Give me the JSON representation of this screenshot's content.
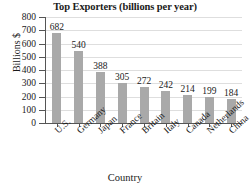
{
  "chart_data": {
    "type": "bar",
    "title": "Top Exporters (billions per year)",
    "xlabel": "Country",
    "ylabel": "Billions $",
    "categories": [
      "U.S.",
      "Germany",
      "Japan",
      "France",
      "Britain",
      "Italy",
      "Canada",
      "Netherlands",
      "China"
    ],
    "values": [
      682,
      540,
      388,
      305,
      272,
      242,
      214,
      199,
      184
    ],
    "ylim": [
      0,
      800
    ],
    "yticks": [
      800,
      700,
      600,
      500,
      400,
      300,
      200,
      100,
      0
    ],
    "ytick_labels": [
      "800",
      "700",
      "600",
      "500",
      "400",
      "300",
      "200",
      "100",
      "0"
    ],
    "value_labels": [
      "682",
      "540",
      "388",
      "305",
      "272",
      "242",
      "214",
      "199",
      "184"
    ],
    "grid": true,
    "legend": false,
    "bar_color": "#a9a9a9",
    "grid_color": "#dedede",
    "axis_color": "#555555",
    "text_color": "#1a1a1a",
    "background": "#ffffff"
  }
}
